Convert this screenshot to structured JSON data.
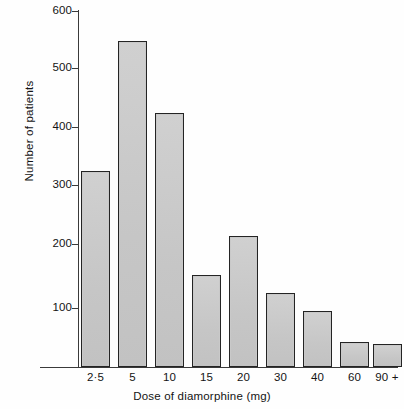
{
  "chart_data": {
    "type": "bar",
    "title": "",
    "subtitle": "",
    "categories": [
      "2·5",
      "5",
      "10",
      "15",
      "20",
      "30",
      "40",
      "60",
      "90 +"
    ],
    "values": [
      330,
      550,
      428,
      155,
      220,
      125,
      95,
      42,
      38
    ],
    "series": [
      {
        "name": "Number of patients",
        "values": [
          330,
          550,
          428,
          155,
          220,
          125,
          95,
          42,
          38
        ]
      }
    ],
    "xlabel": "Dose of diamorphine (mg)",
    "ylabel": "Number of patients",
    "ylim": [
      0,
      600
    ],
    "ytick_labels": [
      "600",
      "500",
      "400",
      "300",
      "200",
      "100"
    ],
    "ytick_values": [
      600,
      500,
      400,
      300,
      200,
      100
    ],
    "ytick_step": 100,
    "grid": false,
    "legend": false,
    "legend_position": "none",
    "bar_fill_color": "#c9c9c9",
    "bar_edge_color": "#242424",
    "axis_color": "#3a3a3a",
    "background_color": "#ffffff",
    "annotations": []
  },
  "axes": {
    "y_label": "Number of patients",
    "x_label": "Dose of diamorphine (mg)"
  }
}
